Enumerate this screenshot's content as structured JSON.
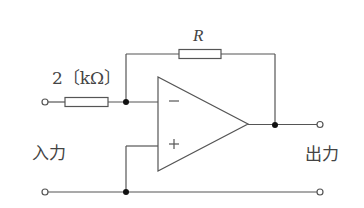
{
  "diagram": {
    "type": "inverting-amplifier-circuit",
    "input_resistor_label": "2〔kΩ〕",
    "feedback_resistor_label": "R",
    "input_label": "入力",
    "output_label": "出力",
    "opamp_inverting_symbol": "−",
    "opamp_noninverting_symbol": "+",
    "colors": {
      "wire": "#555555",
      "node": "#111111",
      "text": "#444444",
      "background": "#ffffff"
    }
  }
}
